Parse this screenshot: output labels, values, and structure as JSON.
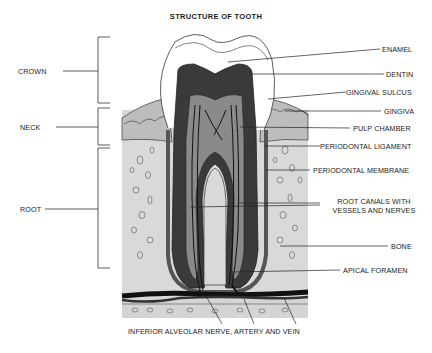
{
  "title": "STRUCTURE OF TOOTH",
  "regions": {
    "crown": "CROWN",
    "neck": "NECK",
    "root": "ROOT"
  },
  "labels": {
    "enamel": "ENAMEL",
    "dentin": "DENTIN",
    "gingival_sulcus": "GINGIVAL SULCUS",
    "gingiva": "GINGIVA",
    "pulp_chamber": "PULP CHAMBER",
    "periodontal_ligament": "PERIODONTAL LIGAMENT",
    "periodontal_membrane": "PERIODONTAL MEMBRANE",
    "root_canals_line1": "ROOT CANALS WITH",
    "root_canals_line2": "VESSELS AND NERVES",
    "bone": "BONE",
    "apical_foramen": "APICAL FORAMEN",
    "inferior_alveolar": "INFERIOR ALVEOLAR NERVE, ARTERY AND VEIN"
  },
  "colors": {
    "bone_fill": "#d9d9d9",
    "gingiva_fill": "#bdbdbd",
    "dentin_fill": "#3a3a3a",
    "pulp_fill": "#8a8a8a",
    "enamel_fill": "#ffffff",
    "line": "#1a1a1a"
  }
}
